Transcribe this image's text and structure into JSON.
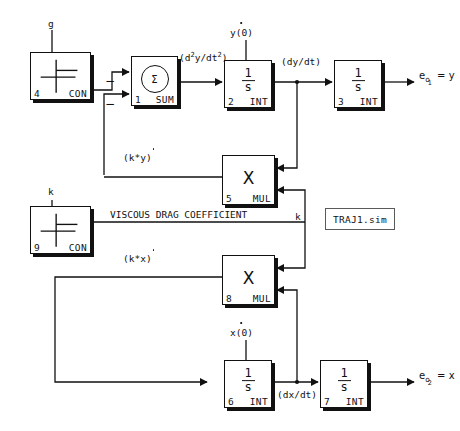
{
  "diagram": {
    "title": "TRAJ1.sim",
    "file_tag": "TRAJ1.sim",
    "annotation_viscous": "VISCOUS DRAG COEFFICIENT"
  },
  "blocks": {
    "con_g": {
      "number": "4",
      "kind": "CON",
      "top_label": "g"
    },
    "sum": {
      "number": "1",
      "kind": "SUM",
      "glyph": "Σ"
    },
    "int2": {
      "number": "2",
      "kind": "INT",
      "numerator": "1",
      "denominator": "s",
      "top_label": "y(0)"
    },
    "int3": {
      "number": "3",
      "kind": "INT",
      "numerator": "1",
      "denominator": "s"
    },
    "mul5": {
      "number": "5",
      "kind": "MUL",
      "glyph": "X"
    },
    "con_k": {
      "number": "9",
      "kind": "CON",
      "top_label": "k"
    },
    "mul8": {
      "number": "8",
      "kind": "MUL",
      "glyph": "X"
    },
    "int6": {
      "number": "6",
      "kind": "INT",
      "numerator": "1",
      "denominator": "s",
      "top_label": "x(0)"
    },
    "int7": {
      "number": "7",
      "kind": "INT",
      "numerator": "1",
      "denominator": "s"
    }
  },
  "signals": {
    "d2y_dt2": "(d",
    "d2y_dt2_var": "y/dt",
    "dy_dt": "(dy/dt)",
    "dx_dt": "(dx/dt)",
    "k_times_ydot": "(k*y)",
    "k_times_xdot": "(k*x)",
    "k_label": "k",
    "exp_two": "2"
  },
  "outputs": {
    "out1": {
      "base": "e",
      "sub_o": "o",
      "sub_n": "1",
      "equals": "= y"
    },
    "out2": {
      "base": "e",
      "sub_o": "o",
      "sub_n": "2",
      "equals": "= x"
    }
  },
  "signs": {
    "minus_a": "−",
    "minus_b": "−"
  }
}
